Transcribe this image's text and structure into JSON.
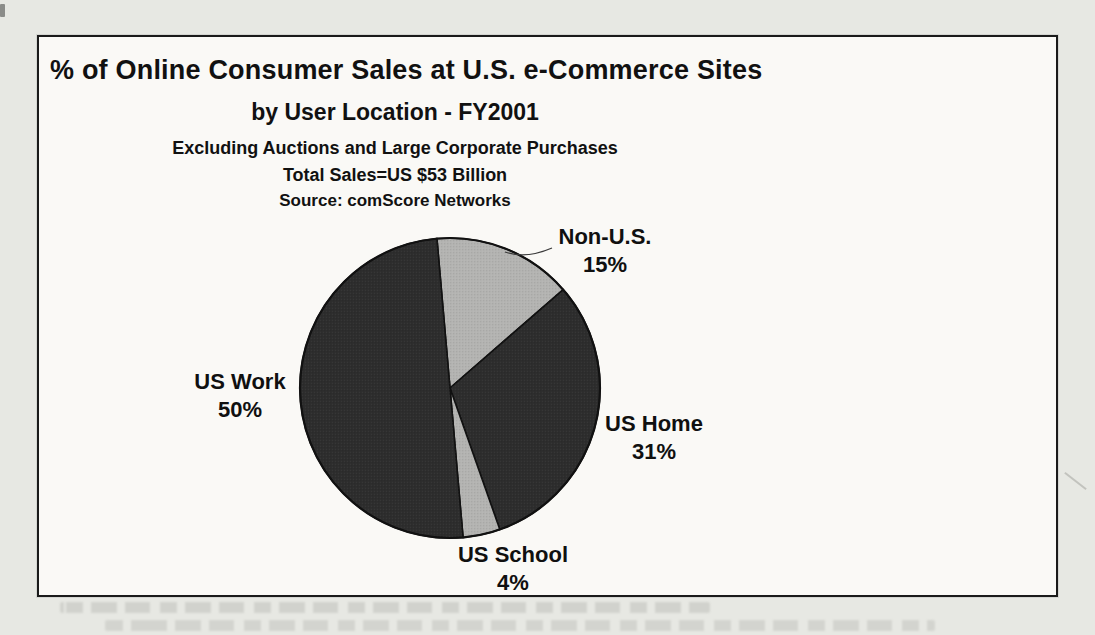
{
  "document": {
    "kind": "scanned-book-page-with-chart"
  },
  "colors": {
    "page_background": "#e7e8e3",
    "frame_background": "#faf9f6",
    "frame_border": "#1a1a1a",
    "text": "#111111",
    "slice_border": "#111111",
    "pie_outline": "#111111",
    "leader_line": "#3a3a3a",
    "dark_slice": "#2d2d2d",
    "light_slice": "#b4b4b2"
  },
  "chart_data": {
    "type": "pie",
    "title_line1": "% of Online Consumer Sales at U.S. e-Commerce Sites",
    "title_line2": "by User Location - FY2001",
    "note_line1": "Excluding Auctions and Large Corporate Purchases",
    "note_line2": "Total Sales=US $53 Billion",
    "source": "Source: comScore Networks",
    "legend_position": "none",
    "labels": "outside",
    "start_angle_deg": -5,
    "direction": "clockwise",
    "total_percent": 100,
    "slices": [
      {
        "id": "non-us",
        "label": "Non-U.S.",
        "value": 15,
        "display": "15%",
        "color": "#b4b4b2"
      },
      {
        "id": "us-home",
        "label": "US Home",
        "value": 31,
        "display": "31%",
        "color": "#2d2d2d"
      },
      {
        "id": "us-school",
        "label": "US School",
        "value": 4,
        "display": "4%",
        "color": "#b4b4b2"
      },
      {
        "id": "us-work",
        "label": "US Work",
        "value": 50,
        "display": "50%",
        "color": "#2d2d2d"
      }
    ]
  }
}
